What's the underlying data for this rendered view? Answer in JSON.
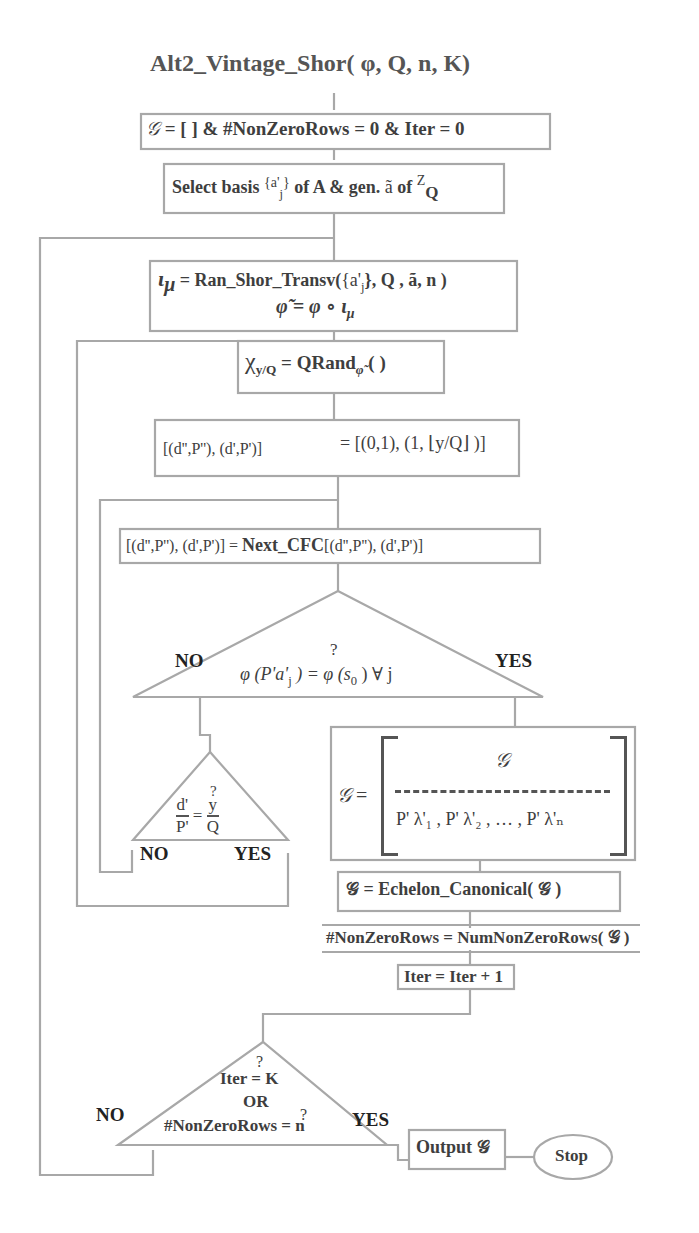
{
  "title": {
    "function_name": "Alt2_Vintage_Shor",
    "params": "( φ, Q, n, K)"
  },
  "nodes": {
    "init": {
      "G": "𝒢",
      "text": " = [  ]   &   #NonZeroRows = 0 & Iter = 0"
    },
    "select": {
      "prefix": "Select basis",
      "set": "{a'",
      "set_sub": "j",
      "set_close": "}",
      "mid": " of A & gen. ",
      "atilde": "ã",
      "of": " of ",
      "Z": "Z",
      "Z_sub": "Q"
    },
    "transversal": {
      "line1_iota": "ι",
      "line1_iota_sub": "μ",
      "line1_fn": " = Ran_Shor_Transv(",
      "line1_args": "{a'",
      "line1_args_sub": "j",
      "line1_args_rest": "}, Q , ã, n )",
      "line2": "φ̃ = φ ∘ ι",
      "line2_sub": "μ"
    },
    "qrand": {
      "chi": "χ",
      "chi_sub": "y/Q",
      "eq": " =  QRand",
      "phi_sub": "φ̃",
      "paren": " ( )"
    },
    "cfc_init": {
      "lhs": "[(d'',P''), (d',P')]",
      "rhs": "= [(0,1), (1, ⌊y/Q⌋ )]"
    },
    "next_cfc": {
      "lhs": "[(d'',P''), (d',P')] = ",
      "fn": "Next_CFC",
      "rhs": "[(d'',P''), (d',P')]"
    },
    "decision1": {
      "q": "?",
      "expr": "φ (P'a'",
      "expr_sub": "j",
      "expr_rest": " ) = φ (s",
      "s_sub": "0",
      "tail": " )  ∀ j",
      "no": "NO",
      "yes": "YES"
    },
    "decision2": {
      "q": "?",
      "num1": "d'",
      "den1": "P'",
      "eq": "=",
      "num2": "y",
      "den2": "Q",
      "no": "NO",
      "yes": "YES"
    },
    "matrix": {
      "G": "𝒢",
      "eq": " = ",
      "top": "𝒢",
      "row": "P' λ'₁ , P' λ'₂ , … , P' λ'ₙ"
    },
    "echelon": {
      "text": "𝒢  = Echelon_Canonical( 𝒢 )"
    },
    "nonzero": {
      "text": "#NonZeroRows = NumNonZeroRows( 𝒢 )"
    },
    "iter_inc": {
      "text": "Iter = Iter + 1"
    },
    "decision3": {
      "q1": "?",
      "line1": "Iter = K",
      "line2": "OR",
      "q2": "?",
      "line3": "#NonZeroRows = n",
      "no": "NO",
      "yes": "YES"
    },
    "output": {
      "text": "Output  𝒢"
    },
    "stop": {
      "text": "Stop"
    }
  },
  "colors": {
    "line": "#a8a8a8",
    "text": "#3e3e3e",
    "label": "#222222"
  }
}
